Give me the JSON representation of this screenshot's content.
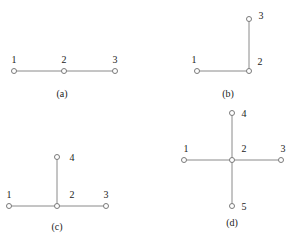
{
  "colors": {
    "edge": "#8a8a8a",
    "node_stroke": "#7a7a7a",
    "text": "#222222",
    "background": "#ffffff"
  },
  "diagrams": [
    {
      "id": "a",
      "caption": "(a)",
      "caption_pos": [
        62,
        94
      ],
      "nodes": [
        {
          "label": "1",
          "x": 14,
          "y": 71,
          "lx": 14,
          "ly": 60
        },
        {
          "label": "2",
          "x": 64,
          "y": 71,
          "lx": 64,
          "ly": 60
        },
        {
          "label": "3",
          "x": 115,
          "y": 71,
          "lx": 115,
          "ly": 60
        }
      ],
      "edges": [
        [
          0,
          1
        ],
        [
          1,
          2
        ]
      ]
    },
    {
      "id": "b",
      "caption": "(b)",
      "caption_pos": [
        228,
        94
      ],
      "nodes": [
        {
          "label": "1",
          "x": 197,
          "y": 71,
          "lx": 194,
          "ly": 60
        },
        {
          "label": "2",
          "x": 249,
          "y": 71,
          "lx": 260,
          "ly": 62
        },
        {
          "label": "3",
          "x": 249,
          "y": 19,
          "lx": 261,
          "ly": 16
        }
      ],
      "edges": [
        [
          0,
          1
        ],
        [
          1,
          2
        ]
      ]
    },
    {
      "id": "c",
      "caption": "(c)",
      "caption_pos": [
        57,
        227
      ],
      "nodes": [
        {
          "label": "1",
          "x": 9,
          "y": 206,
          "lx": 9,
          "ly": 195
        },
        {
          "label": "2",
          "x": 57,
          "y": 206,
          "lx": 72,
          "ly": 195
        },
        {
          "label": "3",
          "x": 106,
          "y": 206,
          "lx": 106,
          "ly": 195
        },
        {
          "label": "4",
          "x": 57,
          "y": 157,
          "lx": 72,
          "ly": 158
        }
      ],
      "edges": [
        [
          0,
          1
        ],
        [
          1,
          2
        ],
        [
          1,
          3
        ]
      ]
    },
    {
      "id": "d",
      "caption": "(d)",
      "caption_pos": [
        232,
        223
      ],
      "nodes": [
        {
          "label": "1",
          "x": 184,
          "y": 160,
          "lx": 186,
          "ly": 149
        },
        {
          "label": "2",
          "x": 232,
          "y": 160,
          "lx": 244,
          "ly": 149
        },
        {
          "label": "3",
          "x": 281,
          "y": 160,
          "lx": 283,
          "ly": 149
        },
        {
          "label": "4",
          "x": 232,
          "y": 113,
          "lx": 244,
          "ly": 114
        },
        {
          "label": "5",
          "x": 232,
          "y": 206,
          "lx": 244,
          "ly": 207
        }
      ],
      "edges": [
        [
          0,
          1
        ],
        [
          1,
          2
        ],
        [
          1,
          3
        ],
        [
          1,
          4
        ]
      ]
    }
  ]
}
